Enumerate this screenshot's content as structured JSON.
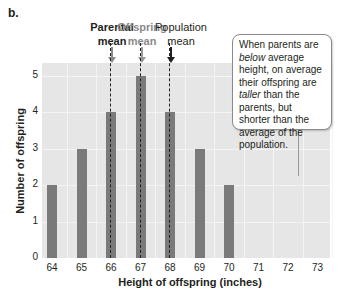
{
  "panel_label": "b.",
  "annotations": {
    "parental_mean": {
      "line1": "Parental",
      "line2": "mean",
      "color": "#231f20",
      "x_value": 66
    },
    "offspring_mean": {
      "line1": "Offspring",
      "line2": "mean",
      "color": "#8a8a8a",
      "x_value": 67
    },
    "population_mean": {
      "line1": "Population",
      "line2": "mean",
      "color": "#231f20",
      "x_value": 68
    }
  },
  "callout": {
    "t1": "When parents are ",
    "t2": "below",
    "t3": " average height, on average their offspring are ",
    "t4": "taller",
    "t5": " than the parents, but shorter than the average of the population."
  },
  "chart_data": {
    "type": "bar",
    "title": "",
    "xlabel": "Height of offspring (inches)",
    "ylabel": "Number of offspring",
    "categories": [
      "64",
      "65",
      "66",
      "67",
      "68",
      "69",
      "70",
      "71",
      "72",
      "73"
    ],
    "values": [
      2,
      3,
      4,
      5,
      4,
      3,
      2,
      0,
      0,
      0
    ],
    "yticks": [
      "0",
      "1",
      "2",
      "3",
      "4",
      "5"
    ],
    "ylim": [
      0,
      5.3
    ],
    "grid": true,
    "bar_color": "#7a7a7a",
    "background_color": "#e6e6e6",
    "reference_lines": [
      {
        "label": "Parental mean",
        "x": 66,
        "style": "dashed"
      },
      {
        "label": "Offspring mean",
        "x": 67,
        "style": "dashed"
      },
      {
        "label": "Population mean",
        "x": 68,
        "style": "dashed"
      }
    ]
  }
}
